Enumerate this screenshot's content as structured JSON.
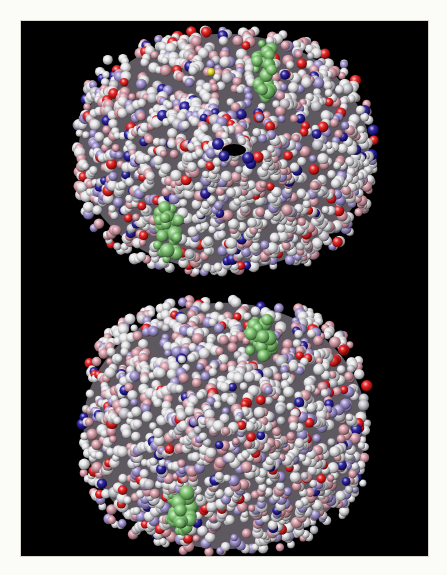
{
  "figure": {
    "alt": "Two space-filling molecular models of a tetrameric protein on a black background, viewed in two orientations",
    "background": "#000000",
    "border_color": "#fbfbf7",
    "panel": {
      "x": 21,
      "y": 21,
      "width": 407,
      "height": 535
    }
  },
  "palette": {
    "carbon_white": "#e6e6ea",
    "light_gray": "#c9c7cf",
    "pink": "#d99aa6",
    "lavender": "#9d8fd0",
    "navy": "#1c1296",
    "red": "#e31212",
    "heme_green": "#78c46a",
    "sulfur_yellow": "#e8dc30",
    "shadow_gray": "#7c6f78"
  },
  "molecules": [
    {
      "name": "molecule-top-view",
      "cx": 203,
      "cy": 131,
      "rx": 150,
      "ry": 122,
      "seed": 11,
      "pit": {
        "cx": 213,
        "cy": 129,
        "rx": 12,
        "ry": 6
      },
      "heme_groups": [
        {
          "cx": 243,
          "cy": 48,
          "rx": 10,
          "ry": 30
        },
        {
          "cx": 147,
          "cy": 210,
          "rx": 13,
          "ry": 30
        }
      ],
      "yellow_atoms": [
        {
          "cx": 190,
          "cy": 51
        }
      ]
    },
    {
      "name": "molecule-bottom-view",
      "cx": 204,
      "cy": 405,
      "rx": 146,
      "ry": 127,
      "seed": 29,
      "pit": null,
      "heme_groups": [
        {
          "cx": 240,
          "cy": 318,
          "rx": 14,
          "ry": 24
        },
        {
          "cx": 160,
          "cy": 490,
          "rx": 14,
          "ry": 22
        }
      ],
      "yellow_atoms": []
    }
  ]
}
